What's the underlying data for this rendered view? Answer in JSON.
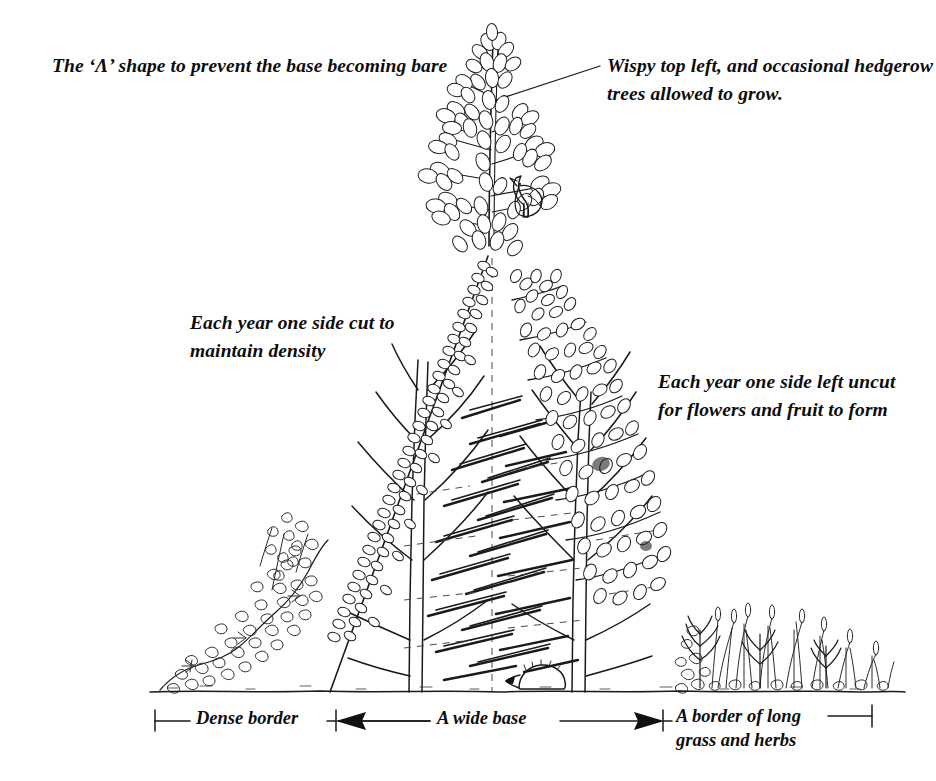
{
  "figure": {
    "kind": "line-drawing",
    "background_color": "#ffffff",
    "ink_color": "#1a1a1a"
  },
  "annotations": {
    "title": "The ‘Λ’ shape to prevent the base becoming bare",
    "wispy_top": "Wispy top left, and occasional hedgerow\ntrees allowed to grow.",
    "side_cut": "Each year one side cut to\nmaintain density",
    "side_uncut": "Each year one side left uncut\nfor flowers and fruit to form"
  },
  "dimensions": {
    "items": [
      {
        "label": "Dense border",
        "style": "tick-line-tick"
      },
      {
        "label": "A wide base",
        "style": "double-arrow"
      },
      {
        "label": "A border of long\ngrass and herbs",
        "style": "tick-line-tick"
      }
    ],
    "dense_border_label": "Dense border",
    "wide_base_label": "A wide base",
    "grass_border_label": "A border of long\ngrass and herbs"
  },
  "scene_elements": {
    "hedge_shape": "A-shape / lambda triangle",
    "left_face": "clipped dense foliage",
    "right_face": "uncut shaggy flowering growth",
    "sapling": "hedgerow tree allowed to grow at top",
    "bird": "bird perched on sapling branch",
    "hedgehog": "hedgehog at hedge base",
    "ground_line": "soil line",
    "trunks": 2,
    "centerline": "dashed vertical centre line"
  }
}
